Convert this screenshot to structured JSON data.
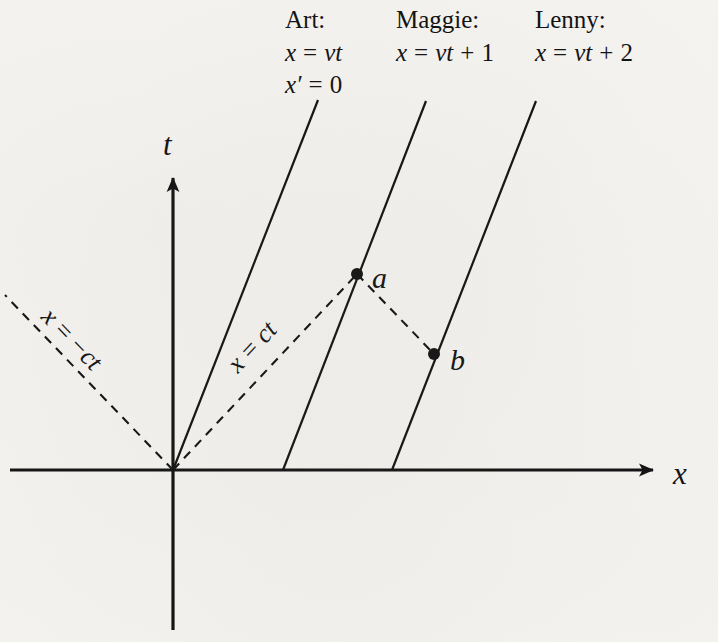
{
  "figure": {
    "kind": "minkowski-spacetime-diagram",
    "background_color": "#f5f4f1",
    "ink_color": "#111111"
  },
  "axes": {
    "x_label": "x",
    "t_label": "t",
    "x_axis": {
      "from": [
        10,
        470
      ],
      "to": [
        658,
        470
      ],
      "arrow": "right"
    },
    "t_axis": {
      "from": [
        173,
        630
      ],
      "to": [
        173,
        172
      ],
      "arrow": "up"
    },
    "origin": [
      173,
      470
    ]
  },
  "legend": {
    "columns": [
      {
        "name": "Art:",
        "equations": [
          "x = vt",
          "x′ = 0"
        ],
        "x": 285,
        "y": 28
      },
      {
        "name": "Maggie:",
        "equations": [
          "x = vt + 1"
        ],
        "x": 396,
        "y": 28
      },
      {
        "name": "Lenny:",
        "equations": [
          "x = vt + 2"
        ],
        "x": 535,
        "y": 28
      }
    ]
  },
  "worldlines": [
    {
      "label": "art-worldline",
      "from": [
        173,
        470
      ],
      "to": [
        318,
        100
      ],
      "style": "solid"
    },
    {
      "label": "maggie-worldline",
      "from": [
        283,
        470
      ],
      "to": [
        426,
        101
      ],
      "style": "solid"
    },
    {
      "label": "lenny-worldline",
      "from": [
        392,
        470
      ],
      "to": [
        536,
        101
      ],
      "style": "solid"
    }
  ],
  "light_cone": [
    {
      "label": "x = ct",
      "text": "x = ct",
      "from": [
        173,
        470
      ],
      "to": [
        357,
        274
      ],
      "style": "dashed",
      "text_anchor": [
        265,
        348
      ],
      "rotation": -47
    },
    {
      "label": "x = -ct",
      "text": "x = −ct",
      "from": [
        173,
        470
      ],
      "to": [
        5,
        295
      ],
      "style": "dashed",
      "text_anchor": [
        78,
        355
      ],
      "rotation": 46
    }
  ],
  "events": [
    {
      "label": "a",
      "at": [
        357,
        274
      ],
      "label_at": [
        375,
        281
      ]
    },
    {
      "label": "b",
      "at": [
        434,
        354
      ],
      "label_at": [
        453,
        362
      ]
    }
  ],
  "connectors": [
    {
      "label": "a-to-b-dashed",
      "from": [
        357,
        274
      ],
      "to": [
        434,
        354
      ],
      "style": "dashed"
    }
  ]
}
